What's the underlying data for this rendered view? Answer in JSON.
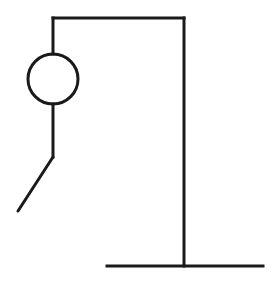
{
  "game": {
    "name": "hangman",
    "wrong_guesses_drawn": 3,
    "parts_visible": [
      "gallows-base",
      "gallows-post",
      "gallows-beam",
      "rope",
      "head",
      "body",
      "left-leg"
    ]
  },
  "colors": {
    "background": "#ffffff",
    "stroke": "#1a1a1a"
  },
  "geometry": {
    "base": {
      "x1": 107,
      "y1": 266,
      "x2": 263,
      "y2": 266
    },
    "post": {
      "x1": 184,
      "y1": 18,
      "x2": 184,
      "y2": 266
    },
    "beam": {
      "x1": 53,
      "y1": 18,
      "x2": 184,
      "y2": 18
    },
    "rope": {
      "x1": 53,
      "y1": 18,
      "x2": 53,
      "y2": 54
    },
    "head": {
      "cx": 53,
      "cy": 79,
      "r": 25
    },
    "body": {
      "x1": 53,
      "y1": 104,
      "x2": 53,
      "y2": 157
    },
    "left_leg": {
      "x1": 53,
      "y1": 157,
      "x2": 18,
      "y2": 211
    }
  }
}
